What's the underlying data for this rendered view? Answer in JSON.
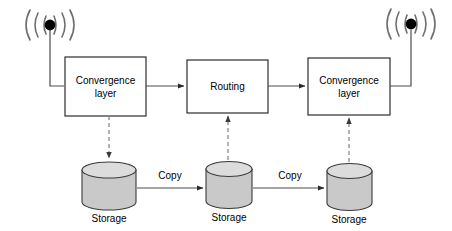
{
  "diagram": {
    "type": "network-architecture-flow-diagram",
    "nodes": [
      {
        "id": "antenna_left",
        "icon": "wireless-antenna-icon",
        "label": ""
      },
      {
        "id": "conv_left",
        "label_line1": "Convergence",
        "label_line2": "layer"
      },
      {
        "id": "routing",
        "label_line1": "Routing",
        "label_line2": ""
      },
      {
        "id": "conv_right",
        "label_line1": "Convergence",
        "label_line2": "layer"
      },
      {
        "id": "antenna_right",
        "icon": "wireless-antenna-icon",
        "label": ""
      },
      {
        "id": "storage_left",
        "label": "Storage"
      },
      {
        "id": "storage_mid",
        "label": "Storage"
      },
      {
        "id": "storage_right",
        "label": "Storage"
      }
    ],
    "edges": [
      {
        "from": "antenna_left",
        "to": "conv_left",
        "label": "",
        "style": "solid"
      },
      {
        "from": "conv_left",
        "to": "routing",
        "label": "",
        "style": "solid"
      },
      {
        "from": "routing",
        "to": "conv_right",
        "label": "",
        "style": "solid"
      },
      {
        "from": "conv_right",
        "to": "antenna_right",
        "label": "",
        "style": "solid"
      },
      {
        "from": "conv_left",
        "to": "storage_left",
        "label": "",
        "style": "dashed",
        "direction": "down"
      },
      {
        "from": "storage_mid",
        "to": "routing",
        "label": "",
        "style": "dashed",
        "direction": "up"
      },
      {
        "from": "storage_right",
        "to": "conv_right",
        "label": "",
        "style": "dashed",
        "direction": "up"
      },
      {
        "from": "storage_left",
        "to": "storage_mid",
        "label": "Copy",
        "style": "solid"
      },
      {
        "from": "storage_mid",
        "to": "storage_right",
        "label": "Copy",
        "style": "solid"
      }
    ],
    "labels": {
      "convergence_left_line1": "Convergence",
      "convergence_left_line2": "layer",
      "routing": "Routing",
      "convergence_right_line1": "Convergence",
      "convergence_right_line2": "layer",
      "storage_left": "Storage",
      "storage_mid": "Storage",
      "storage_right": "Storage",
      "copy_left": "Copy",
      "copy_right": "Copy"
    },
    "colors": {
      "background": "#ffffff",
      "box_stroke": "#1a1a1a",
      "box_fill": "#ffffff",
      "solid_line": "#4d4d4d",
      "dashed_line": "#8c8c8c",
      "cylinder_fill": "#c9c9c9",
      "cylinder_top": "#dcdcdc",
      "cylinder_stroke": "#3a3a3a",
      "antenna_arc": "#6e6e6e",
      "antenna_dot": "#000000",
      "text": "#000000"
    }
  }
}
